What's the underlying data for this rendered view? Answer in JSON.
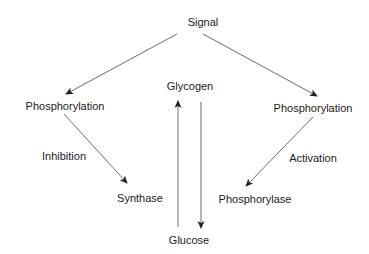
{
  "diagram": {
    "nodes": {
      "signal": "Signal",
      "phosphorylation_left": "Phosphorylation",
      "phosphorylation_right": "Phosphorylation",
      "glycogen": "Glycogen",
      "glucose": "Glucose",
      "synthase": "Synthase",
      "phosphorylase": "Phosphorylase"
    },
    "edge_labels": {
      "inhibition": "Inhibition",
      "activation": "Activation"
    },
    "edges": [
      {
        "from": "Signal",
        "to": "Phosphorylation (left)"
      },
      {
        "from": "Signal",
        "to": "Phosphorylation (right)"
      },
      {
        "from": "Phosphorylation (left)",
        "to": "Synthase",
        "label": "Inhibition"
      },
      {
        "from": "Phosphorylation (right)",
        "to": "Phosphorylase",
        "label": "Activation"
      },
      {
        "from": "Glucose",
        "to": "Glycogen"
      },
      {
        "from": "Glycogen",
        "to": "Glucose"
      }
    ],
    "line_color": "#333333"
  }
}
